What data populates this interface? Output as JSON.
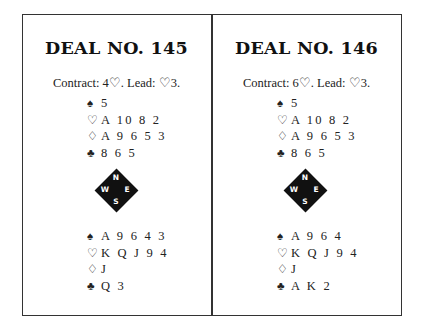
{
  "deals": [
    {
      "title": "DEAL NO. 145",
      "contract": "Contract: 4♡. Lead: ♡3.",
      "north": [
        {
          "suit": "♠",
          "cards": "5"
        },
        {
          "suit": "♡",
          "cards": "A 10 8 2"
        },
        {
          "suit": "♢",
          "cards": "A 9 6 5 3"
        },
        {
          "suit": "♣",
          "cards": "8 6 5"
        }
      ],
      "compass": {
        "n": "N",
        "w": "W",
        "e": "E",
        "s": "S"
      },
      "south": [
        {
          "suit": "♠",
          "cards": "A 9 6 4 3"
        },
        {
          "suit": "♡",
          "cards": "K Q J 9 4"
        },
        {
          "suit": "♢",
          "cards": "J"
        },
        {
          "suit": "♣",
          "cards": "Q 3"
        }
      ]
    },
    {
      "title": "DEAL NO. 146",
      "contract": "Contract: 6♡. Lead: ♡3.",
      "north": [
        {
          "suit": "♠",
          "cards": "5"
        },
        {
          "suit": "♡",
          "cards": "A 10 8 2"
        },
        {
          "suit": "♢",
          "cards": "A 9 6 5 3"
        },
        {
          "suit": "♣",
          "cards": "8 6 5"
        }
      ],
      "compass": {
        "n": "N",
        "w": "W",
        "e": "E",
        "s": "S"
      },
      "south": [
        {
          "suit": "♠",
          "cards": "A 9 6 4"
        },
        {
          "suit": "♡",
          "cards": "K Q J 9 4"
        },
        {
          "suit": "♢",
          "cards": "J"
        },
        {
          "suit": "♣",
          "cards": "A K 2"
        }
      ]
    }
  ]
}
